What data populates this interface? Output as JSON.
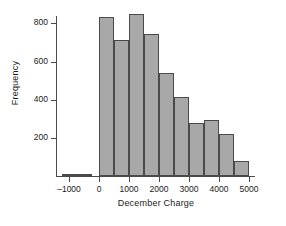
{
  "chart_data": {
    "type": "bar",
    "title": "",
    "subtitle": "",
    "xlabel": "December Charge",
    "ylabel": "Frequency",
    "grid": false,
    "legend": null,
    "xlim": [
      -1400,
      5200
    ],
    "ylim": [
      0,
      870
    ],
    "x_ticks": [
      -1000,
      0,
      1000,
      2000,
      3000,
      4000,
      5000
    ],
    "x_tick_labels": [
      "–1000",
      "0",
      "1000",
      "2000",
      "3000",
      "4000",
      "5000"
    ],
    "y_ticks": [
      200,
      400,
      600,
      800
    ],
    "y_tick_labels": [
      "200",
      "400",
      "600",
      "800"
    ],
    "bin_width": 500,
    "bars": [
      {
        "bin_start": -1250,
        "bin_end": -750,
        "value": 4
      },
      {
        "bin_start": -750,
        "bin_end": -250,
        "value": 10
      },
      {
        "bin_start": 0,
        "bin_end": 500,
        "value": 835
      },
      {
        "bin_start": 500,
        "bin_end": 1000,
        "value": 715
      },
      {
        "bin_start": 1000,
        "bin_end": 1500,
        "value": 850
      },
      {
        "bin_start": 1500,
        "bin_end": 2000,
        "value": 745
      },
      {
        "bin_start": 2000,
        "bin_end": 2500,
        "value": 540
      },
      {
        "bin_start": 2500,
        "bin_end": 3000,
        "value": 415
      },
      {
        "bin_start": 3000,
        "bin_end": 3500,
        "value": 280
      },
      {
        "bin_start": 3500,
        "bin_end": 4000,
        "value": 295
      },
      {
        "bin_start": 4000,
        "bin_end": 4500,
        "value": 222
      },
      {
        "bin_start": 4500,
        "bin_end": 5000,
        "value": 80
      }
    ],
    "categories": [
      "-1250 to -750",
      "-750 to -250",
      "0 to 500",
      "500 to 1000",
      "1000 to 1500",
      "1500 to 2000",
      "2000 to 2500",
      "2500 to 3000",
      "3000 to 3500",
      "3500 to 4000",
      "4000 to 4500",
      "4500 to 5000"
    ],
    "values": [
      4,
      10,
      835,
      715,
      850,
      745,
      540,
      415,
      280,
      295,
      222,
      80
    ],
    "colors": {
      "bar_fill": "#a8a8a8",
      "bar_edge": "#4a4a4a",
      "axis": "#4a4a4a",
      "text": "#1a1a1a",
      "background": "#ffffff"
    }
  }
}
